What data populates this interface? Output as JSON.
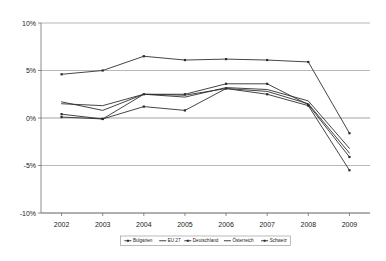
{
  "chart_data": {
    "type": "line",
    "title": "",
    "xlabel": "",
    "ylabel": "",
    "categories": [
      "2002",
      "2003",
      "2004",
      "2005",
      "2006",
      "2007",
      "2008",
      "2009"
    ],
    "x": [
      2002,
      2003,
      2004,
      2005,
      2006,
      2007,
      2008,
      2009
    ],
    "ylim": [
      -10,
      10
    ],
    "y_ticks": [
      10,
      5,
      0,
      -5,
      -10
    ],
    "y_tick_labels": [
      "10%",
      "5%",
      "0%",
      "-5%",
      "-10%"
    ],
    "grid": true,
    "legend_position": "bottom",
    "value_suffix": "%",
    "series": [
      {
        "name": "Bulgarien",
        "marker": "square",
        "values": [
          4.6,
          5.0,
          6.5,
          6.1,
          6.2,
          6.1,
          5.9,
          -1.6
        ]
      },
      {
        "name": "EU 27",
        "marker": "none",
        "values": [
          1.5,
          1.3,
          2.5,
          2.2,
          3.2,
          3.0,
          1.8,
          -3.2
        ]
      },
      {
        "name": "Deutschland",
        "marker": "square",
        "values": [
          0.4,
          -0.1,
          2.5,
          2.5,
          3.6,
          3.6,
          1.4,
          -4.1
        ]
      },
      {
        "name": "Österreich",
        "marker": "dash",
        "values": [
          1.7,
          0.8,
          2.5,
          2.4,
          3.1,
          2.8,
          1.5,
          -3.7
        ]
      },
      {
        "name": "Schweiz",
        "marker": "square",
        "values": [
          0.1,
          -0.1,
          1.2,
          0.8,
          3.1,
          2.5,
          1.3,
          -5.5
        ]
      }
    ]
  },
  "legend": {
    "items": [
      {
        "label": "Bulgarien"
      },
      {
        "label": "EU 27"
      },
      {
        "label": "Deutschland"
      },
      {
        "label": "Österreich"
      },
      {
        "label": "Schweiz"
      }
    ]
  }
}
